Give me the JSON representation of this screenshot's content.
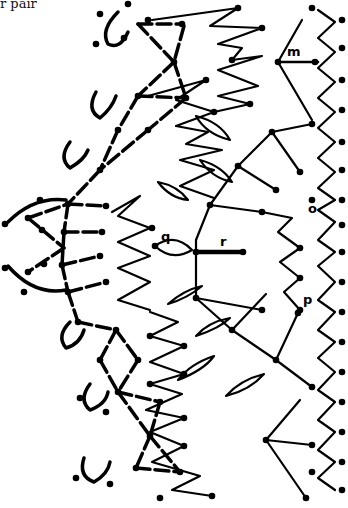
{
  "caption": "r pair",
  "diagram": {
    "type": "crochet-stitch-chart",
    "ink_color": "#000000",
    "background": "#ffffff",
    "labels": [
      {
        "id": "m",
        "text": "m",
        "x": 293,
        "y": 58
      },
      {
        "id": "o",
        "text": "o",
        "x": 308,
        "y": 213
      },
      {
        "id": "p",
        "text": "p",
        "x": 303,
        "y": 304
      },
      {
        "id": "q",
        "text": "q",
        "x": 164,
        "y": 241
      },
      {
        "id": "r",
        "text": "r",
        "x": 222,
        "y": 244
      }
    ]
  }
}
